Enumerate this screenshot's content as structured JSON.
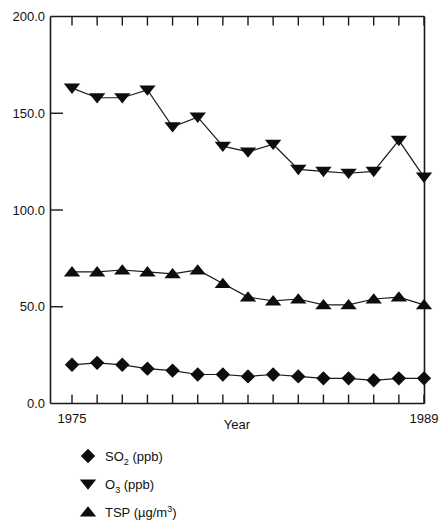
{
  "chart_data": {
    "type": "line",
    "title": "",
    "subtitle": "",
    "xlabel": "Year",
    "ylabel": "",
    "x": [
      1975,
      1976,
      1977,
      1978,
      1979,
      1980,
      1981,
      1982,
      1983,
      1984,
      1985,
      1986,
      1987,
      1988,
      1989
    ],
    "xlim": [
      1975,
      1989
    ],
    "ylim": [
      0.0,
      200.0
    ],
    "grid": false,
    "legend_position": "below-left",
    "y_tick_labels": [
      "200.0",
      "150.0",
      "100.0",
      "50.0",
      "0.0"
    ],
    "y_tick_values": [
      200.0,
      150.0,
      100.0,
      50.0,
      0.0
    ],
    "x_tick_labels_shown": [
      "1975",
      "1989"
    ],
    "x_tick_count": 15,
    "series": [
      {
        "name": "SO2 (ppb)",
        "marker": "diamond",
        "color": "#0d0d0d",
        "values": [
          20,
          21,
          20,
          18,
          17,
          15,
          15,
          14,
          15,
          14,
          13,
          13,
          12,
          13,
          13
        ]
      },
      {
        "name": "O3 (ppb)",
        "marker": "triangle-down",
        "color": "#0d0d0d",
        "values": [
          163,
          158,
          158,
          162,
          143,
          148,
          133,
          130,
          134,
          121,
          120,
          119,
          120,
          136,
          117
        ]
      },
      {
        "name": "TSP (ug/m3)",
        "marker": "triangle-up",
        "color": "#0d0d0d",
        "values": [
          68,
          68,
          69,
          68,
          67,
          69,
          62,
          55,
          53,
          54,
          51,
          51,
          54,
          55,
          51
        ]
      }
    ]
  },
  "axes": {
    "y_labels": {
      "t200": "200.0",
      "t150": "150.0",
      "t100": "100.0",
      "t50": "50.0",
      "t0": "0.0"
    },
    "x_labels": {
      "first": "1975",
      "last": "1989"
    },
    "x_title": "Year"
  },
  "legend": {
    "items": [
      {
        "marker": "diamond",
        "base": "SO",
        "sub": "2",
        "tail": " (ppb)",
        "full": "SO2 (ppb)"
      },
      {
        "marker": "triangle-down",
        "base": "O",
        "sub": "3",
        "tail": " (ppb)",
        "full": "O3 (ppb)"
      },
      {
        "marker": "triangle-up",
        "base": "TSP (µg/m",
        "sup": "3",
        "tail": ")",
        "full": "TSP (µg/m3)"
      }
    ]
  }
}
